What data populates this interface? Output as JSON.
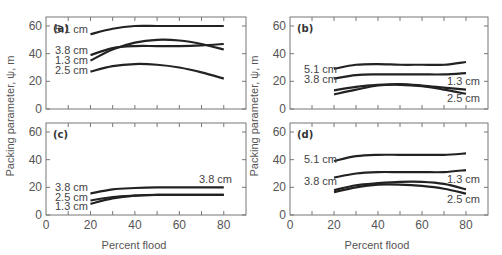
{
  "figure": {
    "ylabel": "Packing parameter, ψ, m",
    "xlabel": "Percent flood"
  },
  "chart_data": [
    {
      "type": "line",
      "panel": "(a)",
      "xlabel": "Percent flood",
      "ylabel": "Packing parameter, ψ, m",
      "xlim": [
        0,
        90
      ],
      "ylim": [
        0,
        65
      ],
      "xticks": [
        0,
        20,
        40,
        60,
        80
      ],
      "yticks": [
        0,
        20,
        40,
        60
      ],
      "x": [
        20,
        30,
        40,
        50,
        60,
        70,
        80
      ],
      "series": [
        {
          "name": "5.1 cm",
          "values": [
            54,
            58,
            60,
            60,
            60,
            60,
            60
          ]
        },
        {
          "name": "3.8 cm",
          "values": [
            39,
            44,
            45.5,
            45.5,
            45.5,
            46,
            47
          ]
        },
        {
          "name": "1.3 cm",
          "values": [
            35,
            43,
            48,
            50,
            49.5,
            47,
            43
          ]
        },
        {
          "name": "2.5 cm",
          "values": [
            27,
            31,
            32.5,
            32,
            30,
            26.5,
            22
          ]
        }
      ]
    },
    {
      "type": "line",
      "panel": "(b)",
      "xlabel": "Percent flood",
      "ylabel": "Packing parameter, ψ, m",
      "xlim": [
        0,
        90
      ],
      "ylim": [
        0,
        65
      ],
      "xticks": [
        0,
        20,
        40,
        60,
        80
      ],
      "yticks": [
        0,
        20,
        40,
        60
      ],
      "x": [
        20,
        30,
        40,
        50,
        60,
        70,
        80
      ],
      "series": [
        {
          "name": "5.1 cm",
          "values": [
            29,
            32,
            32.5,
            32,
            32,
            32,
            34
          ]
        },
        {
          "name": "3.8 cm",
          "values": [
            22,
            24.5,
            25,
            25,
            25,
            25,
            26
          ]
        },
        {
          "name": "1.3 cm",
          "values": [
            13.5,
            16,
            17.5,
            18,
            17,
            15.5,
            14
          ]
        },
        {
          "name": "2.5 cm",
          "values": [
            10.5,
            14,
            17,
            17.5,
            16.5,
            14,
            11
          ]
        }
      ]
    },
    {
      "type": "line",
      "panel": "(c)",
      "xlabel": "Percent flood",
      "ylabel": "Packing parameter, ψ, m",
      "xlim": [
        0,
        90
      ],
      "ylim": [
        0,
        65
      ],
      "xticks": [
        0,
        20,
        40,
        60,
        80
      ],
      "yticks": [
        0,
        20,
        40,
        60
      ],
      "x": [
        20,
        30,
        40,
        50,
        60,
        70,
        80
      ],
      "series": [
        {
          "name": "3.8 cm",
          "values": [
            15.5,
            18.5,
            19.5,
            20,
            20,
            20,
            20
          ]
        },
        {
          "name": "2.5 cm",
          "values": [
            10.5,
            13,
            14,
            14.5,
            14.5,
            14.5,
            14.5
          ]
        },
        {
          "name": "1.3 cm",
          "values": [
            8,
            12,
            14,
            14.5,
            14.5,
            14.5,
            14.5
          ]
        }
      ]
    },
    {
      "type": "line",
      "panel": "(d)",
      "xlabel": "Percent flood",
      "ylabel": "Packing parameter, ψ, m",
      "xlim": [
        0,
        90
      ],
      "ylim": [
        0,
        65
      ],
      "xticks": [
        0,
        20,
        40,
        60,
        80
      ],
      "yticks": [
        0,
        20,
        40,
        60
      ],
      "x": [
        20,
        30,
        40,
        50,
        60,
        70,
        80
      ],
      "series": [
        {
          "name": "5.1 cm",
          "values": [
            39,
            42.5,
            43.5,
            43.5,
            43.5,
            43.5,
            44.5
          ]
        },
        {
          "name": "3.8 cm",
          "values": [
            27,
            30,
            31,
            31,
            31,
            31,
            32.5
          ]
        },
        {
          "name": "1.3 cm",
          "values": [
            18,
            21.5,
            23,
            24,
            24,
            22.5,
            18.5
          ]
        },
        {
          "name": "2.5 cm",
          "values": [
            16.5,
            20,
            22,
            22,
            21,
            19,
            15.5
          ]
        }
      ]
    }
  ]
}
